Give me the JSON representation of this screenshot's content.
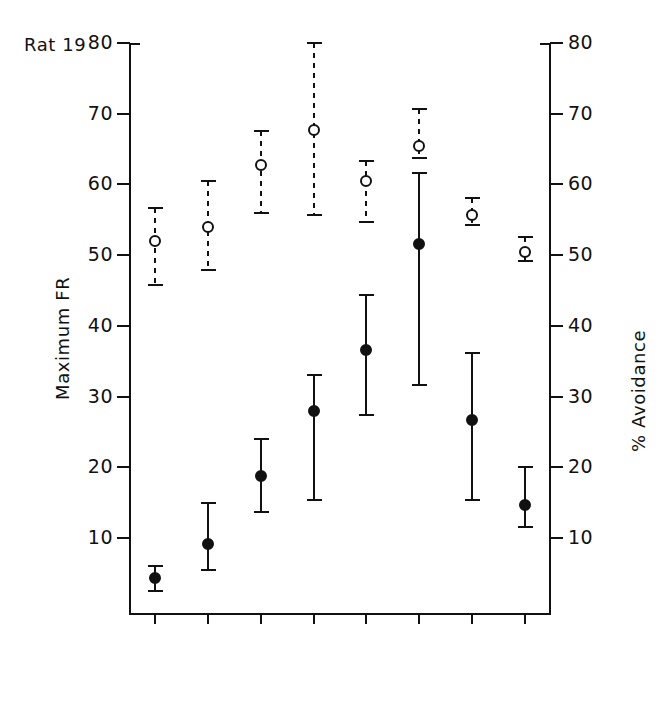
{
  "figure": {
    "subject_label": "Rat 19",
    "axis_left_title": "Maximum FR",
    "axis_right_title": "% Avoidance",
    "y_ticks": [
      10,
      20,
      30,
      40,
      50,
      60,
      70,
      80
    ]
  },
  "chart_data": {
    "type": "scatter",
    "title": "Rat 19",
    "xlabel": "",
    "ylabel": "Maximum FR",
    "ylabel_right": "% Avoidance",
    "ylim": [
      0,
      80
    ],
    "y_ticks": [
      10,
      20,
      30,
      40,
      50,
      60,
      70,
      80
    ],
    "grid": false,
    "legend": "none",
    "error_bars": "vertical ranges with caps; open-circle series uses dashed bars, filled-circle series uses solid bars",
    "categories": [
      {
        "range": "1-10",
        "cond_line1": "Fix",
        "cond_line2": "warn",
        "cond_line3": "contin."
      },
      {
        "range": "11-20",
        "cond_line1": "Fix",
        "cond_line2": "warn",
        "cond_line3": "inter."
      },
      {
        "range": "21-30",
        "cond_line1": "Fix",
        "cond_line2": "warn",
        "cond_line3": "contin."
      },
      {
        "range": "31-36",
        "cond_line1": "RS post",
        "cond_line2": "contin.",
        "cond_line3": ""
      },
      {
        "range": "37-46",
        "cond_line1": "RS post",
        "cond_line2": "contin.",
        "cond_line3": ""
      },
      {
        "range": "47-56",
        "cond_line1": "RS post",
        "cond_line2": "inter.",
        "cond_line3": ""
      },
      {
        "range": "57-66",
        "cond_line1": "RS post",
        "cond_line2": "contin.",
        "cond_line3": ""
      },
      {
        "range": "67-69",
        "cond_line1": "Fix",
        "cond_line2": "warn",
        "cond_line3": "contin."
      }
    ],
    "series": [
      {
        "name": "% Avoidance",
        "marker": "open-circle",
        "errorbar_style": "dashed",
        "values": [
          52.0,
          54.0,
          62.7,
          67.7,
          60.5,
          65.5,
          55.7,
          50.5
        ],
        "err_low": [
          45.8,
          47.9,
          55.9,
          55.7,
          54.7,
          63.7,
          54.2,
          49.2
        ],
        "err_high": [
          56.6,
          60.5,
          67.6,
          80.0,
          63.3,
          70.7,
          58.1,
          52.6
        ]
      },
      {
        "name": "Maximum FR",
        "marker": "filled-circle",
        "errorbar_style": "solid",
        "values": [
          4.4,
          9.1,
          18.8,
          27.9,
          36.6,
          51.6,
          26.7,
          14.6
        ],
        "err_low": [
          2.5,
          5.5,
          13.7,
          15.4,
          27.4,
          31.6,
          15.4,
          11.5
        ],
        "err_high": [
          6.1,
          15.0,
          24.0,
          33.0,
          44.3,
          61.6,
          36.2,
          20.1
        ]
      }
    ]
  }
}
